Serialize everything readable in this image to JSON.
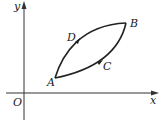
{
  "diagram": {
    "axes": {
      "x_label": "x",
      "y_label": "y",
      "origin_label": "O"
    },
    "points": {
      "A": "A",
      "B": "B",
      "C": "C",
      "D": "D"
    },
    "paths": [
      {
        "name": "A-C-B",
        "from": "A",
        "via": "C",
        "to": "B",
        "direction": "A to B (lower arc)"
      },
      {
        "name": "B-D-A",
        "from": "B",
        "via": "D",
        "to": "A",
        "direction": "arrow on D points toward B (upper arc)"
      }
    ],
    "stroke_color": "#222222"
  }
}
